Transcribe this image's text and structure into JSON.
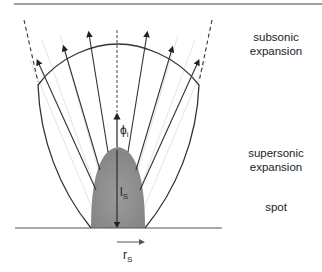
{
  "diagram": {
    "regions": [
      {
        "id": "subsonic",
        "line1": "subsonic",
        "line2": "expansion"
      },
      {
        "id": "supersonic",
        "line1": "supersonic",
        "line2": "expansion"
      },
      {
        "id": "spot",
        "line1": "spot",
        "line2": ""
      }
    ],
    "symbols": {
      "phi": {
        "main": "ϕ",
        "sub": "i"
      },
      "ls": {
        "main": "l",
        "sub": "S"
      },
      "rs": {
        "main": "r",
        "sub": "S"
      }
    },
    "colors": {
      "line": "#333333",
      "spot_fill": "#8c8c8c",
      "guide": "#e2e2e2"
    }
  }
}
